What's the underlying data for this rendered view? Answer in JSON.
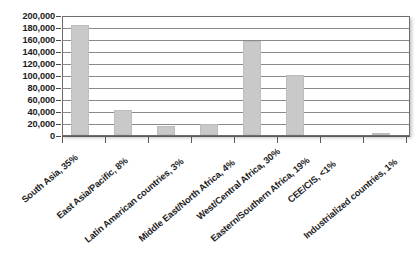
{
  "chart_data": {
    "type": "bar",
    "title": "",
    "subtitle": "",
    "xlabel": "",
    "ylabel": "",
    "categories": [
      "South Asia, 35%",
      "East Asia/Pacific, 8%",
      "Latin American countries, 3%",
      "Middle East/North Africa, 4%",
      "West/Central Africa, 30%",
      "Eastern/Southern Africa, 19%",
      "CEE/CIS, <1%",
      "Industrialized countries, 1%"
    ],
    "values": [
      186000,
      43000,
      16000,
      19000,
      160000,
      102000,
      0,
      3000
    ],
    "ylim": [
      0,
      200000
    ],
    "ytick_values": [
      0,
      20000,
      40000,
      60000,
      80000,
      100000,
      120000,
      140000,
      160000,
      180000,
      200000
    ],
    "ytick_labels": [
      "200,000",
      "180,000",
      "160,000",
      "140,000",
      "120,000",
      "100,000",
      "80,000",
      "60,000",
      "40,000",
      "20,000",
      "0"
    ],
    "grid": true,
    "grid_axis": "y",
    "legend": false,
    "legend_position": "none",
    "bar_color": "#c9c9c9",
    "gridline_color": "#8a8a8a",
    "axis_color": "#5a5a5a",
    "text_color": "#1d1d1d",
    "background_color": "#ffffff",
    "x_tick_label_rotation": -40
  }
}
